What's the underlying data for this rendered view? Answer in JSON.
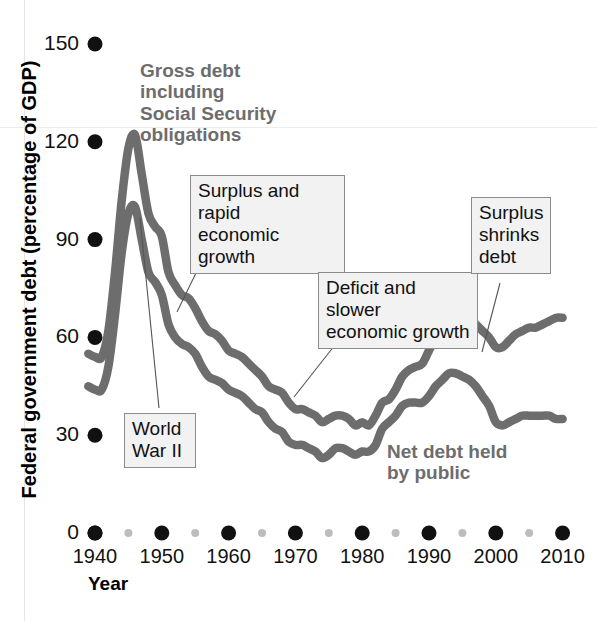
{
  "chart_data": {
    "type": "line",
    "title": "",
    "xlabel": "Year",
    "ylabel": "Federal government debt (percentage of GDP)",
    "xlim": [
      1939,
      2011
    ],
    "ylim": [
      0,
      155
    ],
    "xticks": [
      "1940",
      "1950",
      "1960",
      "1970",
      "1980",
      "1990",
      "2000",
      "2010"
    ],
    "xtick_values": [
      1940,
      1950,
      1960,
      1970,
      1980,
      1990,
      2000,
      2010
    ],
    "xminor_values": [
      1945,
      1955,
      1965,
      1975,
      1985,
      1995,
      2005
    ],
    "yticks": [
      "0",
      "30",
      "60",
      "90",
      "120",
      "150"
    ],
    "ytick_values": [
      0,
      30,
      60,
      90,
      120,
      150
    ],
    "grid": false,
    "legend_position": "inline-annotations",
    "series": [
      {
        "name": "Gross debt including Social Security obligations",
        "color": "#6d6d6d",
        "x": [
          1939,
          1940,
          1941,
          1942,
          1943,
          1944,
          1945,
          1946,
          1947,
          1948,
          1949,
          1950,
          1951,
          1952,
          1953,
          1954,
          1955,
          1956,
          1957,
          1958,
          1959,
          1960,
          1961,
          1962,
          1963,
          1964,
          1965,
          1966,
          1967,
          1968,
          1969,
          1970,
          1971,
          1972,
          1973,
          1974,
          1975,
          1976,
          1977,
          1978,
          1979,
          1980,
          1981,
          1982,
          1983,
          1984,
          1985,
          1986,
          1987,
          1988,
          1989,
          1990,
          1991,
          1992,
          1993,
          1994,
          1995,
          1996,
          1997,
          1998,
          1999,
          2000,
          2001,
          2002,
          2003,
          2004,
          2005,
          2006,
          2007,
          2008,
          2009,
          2010
        ],
        "y": [
          55,
          54,
          54,
          62,
          80,
          102,
          118,
          122,
          110,
          98,
          94,
          91,
          80,
          76,
          73,
          72,
          69,
          65,
          62,
          61,
          59,
          56,
          55,
          54,
          52,
          50,
          48,
          45,
          44,
          43,
          40,
          38,
          38,
          37,
          36,
          34,
          35,
          36,
          36,
          35,
          33,
          34,
          33,
          36,
          40,
          41,
          44,
          48,
          50,
          51,
          52,
          56,
          60,
          64,
          66,
          67,
          67,
          66,
          64,
          62,
          60,
          57,
          57,
          59,
          61,
          62,
          63,
          63,
          64,
          65,
          66,
          66
        ]
      },
      {
        "name": "Net debt held by public",
        "color": "#6d6d6d",
        "x": [
          1939,
          1940,
          1941,
          1942,
          1943,
          1944,
          1945,
          1946,
          1947,
          1948,
          1949,
          1950,
          1951,
          1952,
          1953,
          1954,
          1955,
          1956,
          1957,
          1958,
          1959,
          1960,
          1961,
          1962,
          1963,
          1964,
          1965,
          1966,
          1967,
          1968,
          1969,
          1970,
          1971,
          1972,
          1973,
          1974,
          1975,
          1976,
          1977,
          1978,
          1979,
          1980,
          1981,
          1982,
          1983,
          1984,
          1985,
          1986,
          1987,
          1988,
          1989,
          1990,
          1991,
          1992,
          1993,
          1994,
          1995,
          1996,
          1997,
          1998,
          1999,
          2000,
          2001,
          2002,
          2003,
          2004,
          2005,
          2006,
          2007,
          2008,
          2009,
          2010
        ],
        "y": [
          45,
          44,
          44,
          51,
          67,
          86,
          98,
          100,
          90,
          80,
          77,
          73,
          64,
          60,
          58,
          57,
          55,
          51,
          48,
          47,
          46,
          44,
          43,
          42,
          40,
          38,
          37,
          34,
          32,
          31,
          28,
          27,
          27,
          26,
          25,
          23,
          24,
          26,
          26,
          25,
          24,
          25,
          25,
          27,
          32,
          34,
          36,
          39,
          40,
          40,
          40,
          42,
          45,
          47,
          49,
          49,
          48,
          47,
          45,
          42,
          39,
          34,
          33,
          34,
          35,
          36,
          36,
          36,
          36,
          36,
          35,
          35
        ]
      }
    ],
    "annotations": [
      {
        "id": "gross-debt-label",
        "style": "plain",
        "text": "Gross debt\nincluding\nSocial Security\nobligations"
      },
      {
        "id": "net-debt-label",
        "style": "plain",
        "text": "Net debt held\nby public"
      },
      {
        "id": "world-war-ii",
        "style": "box",
        "text": "World\nWar II"
      },
      {
        "id": "surplus-rapid-growth",
        "style": "box",
        "text": "Surplus and rapid\neconomic growth"
      },
      {
        "id": "deficit-slower-growth",
        "style": "box",
        "text": "Deficit and slower\neconomic growth"
      },
      {
        "id": "surplus-shrinks-debt",
        "style": "box",
        "text": "Surplus\nshrinks\ndebt"
      }
    ],
    "colors": {
      "series_line": "#6d6d6d",
      "axis_dot_major": "#111111",
      "axis_dot_minor": "#bdbdbd",
      "callout_fill": "#f2f2f2",
      "callout_border": "#8b8b8b",
      "text": "#111111",
      "label_gray": "#6d6d6d"
    }
  },
  "axis_titles": {
    "y": "Federal government debt (percentage of GDP)",
    "x": "Year"
  },
  "annotations_text": {
    "gross_debt": "Gross debt\nincluding\nSocial Security\nobligations",
    "net_debt": "Net debt held\nby public",
    "world_war_ii": "World\nWar II",
    "surplus_rapid": "Surplus and rapid\neconomic growth",
    "deficit_slower": "Deficit and slower\neconomic growth",
    "surplus_shrinks": "Surplus\nshrinks\ndebt"
  }
}
